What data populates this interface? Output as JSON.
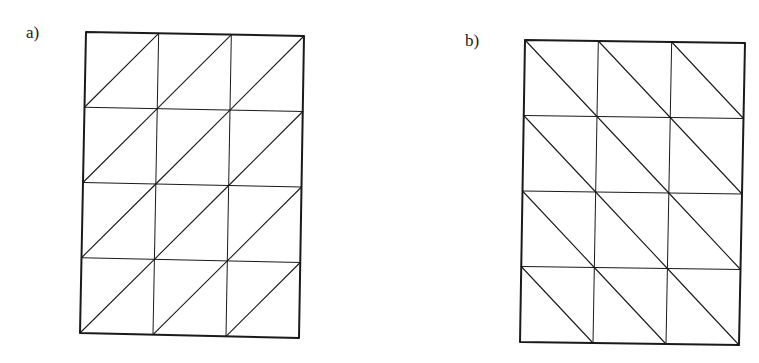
{
  "figures": [
    {
      "label": "a)",
      "label_pos": [
        26,
        23
      ],
      "rows": 4,
      "cols": 3,
      "diagonal": "bottom-left to top-right",
      "corners": {
        "tl": [
          86,
          32
        ],
        "tr": [
          304,
          36
        ],
        "bl": [
          80,
          333
        ],
        "br": [
          299,
          338
        ]
      }
    },
    {
      "label": "b)",
      "label_pos": [
        465,
        31
      ],
      "rows": 4,
      "cols": 3,
      "diagonal": "top-left to bottom-right",
      "corners": {
        "tl": [
          525,
          40
        ],
        "tr": [
          745,
          43
        ],
        "bl": [
          520,
          342
        ],
        "br": [
          739,
          345
        ]
      }
    }
  ],
  "colors": {
    "stroke": "#1a1a1a",
    "background": "#ffffff"
  }
}
